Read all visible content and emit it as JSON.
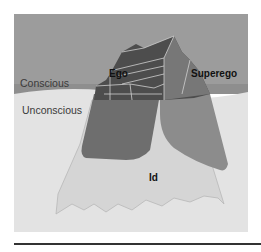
{
  "diagram": {
    "regions": {
      "conscious": "Conscious",
      "unconscious": "Unconscious"
    },
    "parts": {
      "ego": "Ego",
      "superego": "Superego",
      "id": "Id"
    },
    "colors": {
      "above_water": "#9a9a9a",
      "below_water": "#e2e2e2",
      "ego_fill": "#666666",
      "superego_fill": "#8a8a8a",
      "id_fill": "#d4d4d4",
      "peak_dark": "#4a4a4a",
      "rule": "#333333"
    }
  }
}
